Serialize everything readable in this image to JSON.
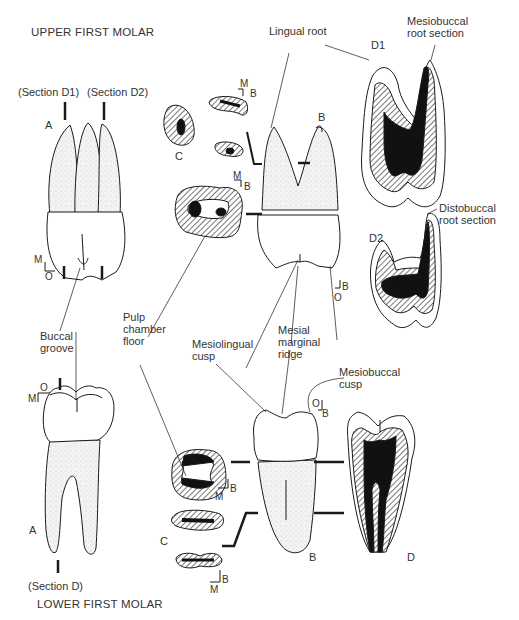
{
  "titles": {
    "upper": "UPPER FIRST MOLAR",
    "lower": "LOWER FIRST MOLAR"
  },
  "sections": {
    "d1_marker": "(Section D1)",
    "d2_marker": "(Section D2)",
    "d_marker": "(Section D)"
  },
  "views": {
    "upper_a": "A",
    "upper_b": "B",
    "upper_c": "C",
    "upper_d1": "D1",
    "upper_d2": "D2",
    "lower_a": "A",
    "lower_b": "B",
    "lower_c": "C",
    "lower_d": "D"
  },
  "orientation": {
    "m": "M",
    "o": "O",
    "b": "B"
  },
  "annotations": {
    "lingual_root": "Lingual root",
    "mesiobuccal_root_section": "Mesiobuccal\nroot section",
    "distobuccal_root_section": "Distobuccal\nroot section",
    "buccal_groove": "Buccal\ngroove",
    "pulp_chamber_floor": "Pulp\nchamber\nfloor",
    "mesiolingual_cusp": "Mesiolingual\ncusp",
    "mesial_marginal_ridge": "Mesial\nmarginal\nridge",
    "mesiobuccal_cusp": "Mesiobuccal\ncusp"
  },
  "colors": {
    "ink": "#1a1a1a",
    "stipple": "#e8e8e8",
    "hatch": "#9a9a9a",
    "pulp": "#111111"
  }
}
